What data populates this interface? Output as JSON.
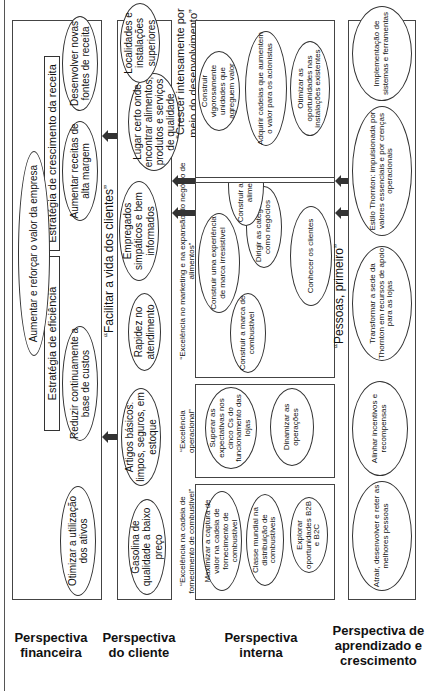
{
  "perspectives": {
    "financial": "Perspectiva financeira",
    "client": "Perspectiva do cliente",
    "internal": "Perspectiva interna",
    "learning": "Perspectiva de aprendizado e crescimento"
  },
  "financial": {
    "goal": "Aumentar e reforçar o valor da empresa",
    "efficiency_strategy": {
      "title": "Estratégia de eficiência",
      "items": [
        "Otimizar a utilização dos ativos",
        "Reduzir continuamente a base de custos"
      ]
    },
    "growth_strategy": {
      "title": "Estratégia de crescimento da receita",
      "items": [
        "Aumentar receitas de alta margem",
        "Desenvolver novas fontes de receita"
      ]
    }
  },
  "client": {
    "theme": "“Facilitar a vida dos clientes”",
    "items": [
      "Gasolina de qualidade a baixo preço",
      "Artigos básicos: limpos, seguros, em estoque",
      "Rapidez no atendimento",
      "Empregados simpáticos e bem informados",
      "Lugar certo onde encontrar alimentos, produtos e serviços de qualidade",
      "Localidades e instalações superiores"
    ]
  },
  "internal": {
    "fuel_chain": {
      "title": "“Excelência na cadeia de fornecimento de combustível”",
      "items": [
        "Maximizar a captura de valor na cadeia de fornecimento de combustível",
        "Classe mundial na distribuição de combustíveis",
        "Explorar oportunidades B2B e B2C"
      ]
    },
    "operational": {
      "title": "“Excelência operacional”",
      "items": [
        "Superar as expectativas nos cinco Cs do funcionamento das lojas",
        "Dinamizar as operações"
      ]
    },
    "marketing": {
      "title": "“Excelência no marketing e na expansão do negócio de alimentos”",
      "items": [
        "Construir a marca de combustível",
        "Construir uma experiência de marca irresistível",
        "Dirigir as categorias como negócios",
        "Conhecer os clientes",
        "Construir a marca de alimentos"
      ]
    },
    "growth": {
      "title": "“Crescer intensamente por meio do desenvolvimento”",
      "items": [
        "Construir vigorosamente unidades que agreguem valor",
        "Adquirir cadeias que aumentem o valor para os acionistas",
        "Otimizar as oportunidades nas instalações existentes"
      ]
    }
  },
  "learning": {
    "theme": "“Pessoas, primeiro”",
    "items": [
      "Atrair, desenvolver e reter as melhores pessoas",
      "Alinhar incentivos e recompensas",
      "Transformar a sede da Thornton em recursos de apoio para as lojas",
      "Estilo Thornton: impulsionada por valores essenciais e por crenças operacionais",
      "Implementação de sistemas e ferramentas"
    ]
  }
}
